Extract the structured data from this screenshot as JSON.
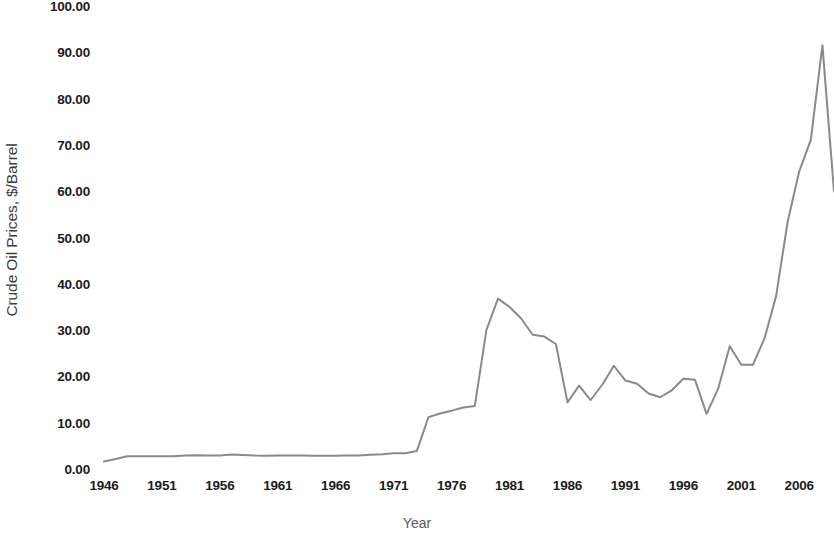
{
  "chart_data": {
    "type": "line",
    "title": "",
    "xlabel": "Year",
    "ylabel": "Crude Oil Prices, $/Barrel",
    "xlim": [
      1946,
      2009
    ],
    "ylim": [
      0,
      100
    ],
    "grid": false,
    "legend": "none",
    "line_color": "#8a8a8a",
    "background_color": "#ffffff",
    "axis_label_color": "#1c1c1c",
    "y_ticks": [
      "0.00",
      "10.00",
      "20.00",
      "30.00",
      "40.00",
      "50.00",
      "60.00",
      "70.00",
      "80.00",
      "90.00",
      "100.00"
    ],
    "y_tick_values": [
      0,
      10,
      20,
      30,
      40,
      50,
      60,
      70,
      80,
      90,
      100
    ],
    "x_ticks": [
      "1946",
      "1951",
      "1956",
      "1961",
      "1966",
      "1971",
      "1976",
      "1981",
      "1986",
      "1991",
      "1996",
      "2001",
      "2006"
    ],
    "x_tick_values": [
      1946,
      1951,
      1956,
      1961,
      1966,
      1971,
      1976,
      1981,
      1986,
      1991,
      1996,
      2001,
      2006
    ],
    "series": [
      {
        "name": "Crude Oil Price",
        "x": [
          1946,
          1947,
          1948,
          1949,
          1950,
          1951,
          1952,
          1953,
          1954,
          1955,
          1956,
          1957,
          1958,
          1959,
          1960,
          1961,
          1962,
          1963,
          1964,
          1965,
          1966,
          1967,
          1968,
          1969,
          1970,
          1971,
          1972,
          1973,
          1974,
          1975,
          1976,
          1977,
          1978,
          1979,
          1980,
          1981,
          1982,
          1983,
          1984,
          1985,
          1986,
          1987,
          1988,
          1989,
          1990,
          1991,
          1992,
          1993,
          1994,
          1995,
          1996,
          1997,
          1998,
          1999,
          2000,
          2001,
          2002,
          2003,
          2004,
          2005,
          2006,
          2007,
          2008,
          2009
        ],
        "values": [
          1.63,
          2.16,
          2.77,
          2.77,
          2.77,
          2.77,
          2.77,
          2.92,
          2.99,
          2.93,
          2.94,
          3.14,
          3.0,
          2.9,
          2.88,
          2.89,
          2.9,
          2.89,
          2.88,
          2.86,
          2.88,
          2.92,
          2.94,
          3.09,
          3.18,
          3.39,
          3.39,
          3.89,
          11.2,
          12.0,
          12.6,
          13.3,
          13.6,
          30.0,
          36.8,
          35.0,
          32.5,
          29.0,
          28.6,
          27.0,
          14.4,
          18.0,
          14.9,
          18.2,
          22.3,
          19.1,
          18.4,
          16.3,
          15.5,
          17.0,
          19.5,
          19.3,
          11.9,
          17.3,
          26.5,
          22.5,
          22.5,
          28.2,
          37.3,
          53.4,
          64.3,
          71.1,
          91.5,
          60.0
        ]
      }
    ]
  },
  "axes": {
    "y_title": "Crude Oil Prices, $/Barrel",
    "x_title": "Year"
  }
}
